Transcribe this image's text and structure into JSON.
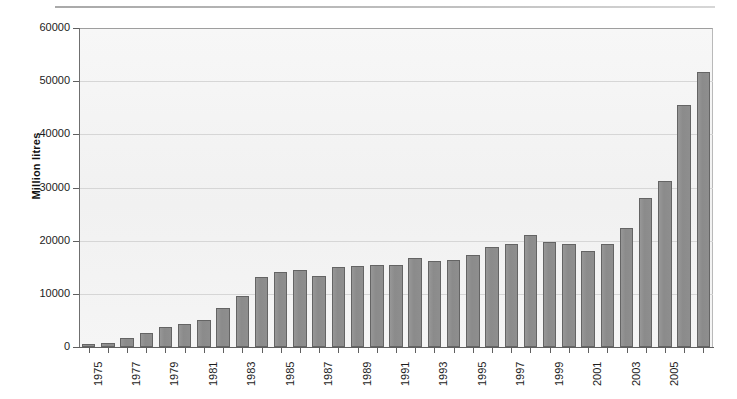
{
  "chart_data": {
    "type": "bar",
    "title": "",
    "xlabel": "",
    "ylabel": "Million litres",
    "ylim": [
      0,
      60000
    ],
    "ytick_values": [
      0,
      10000,
      20000,
      30000,
      40000,
      50000,
      60000
    ],
    "ytick_labels": [
      "0",
      "10000",
      "20000",
      "30000",
      "40000",
      "50000",
      "60000"
    ],
    "grid": true,
    "legend": "none",
    "categories": [
      "1975",
      "1976",
      "1977",
      "1978",
      "1979",
      "1980",
      "1981",
      "1982",
      "1983",
      "1984",
      "1985",
      "1986",
      "1987",
      "1988",
      "1989",
      "1990",
      "1991",
      "1992",
      "1993",
      "1994",
      "1995",
      "1996",
      "1997",
      "1998",
      "1999",
      "2000",
      "2001",
      "2002",
      "2003",
      "2004",
      "2005",
      "2006"
    ],
    "visible_xtick_labels": [
      "1975",
      "1977",
      "1979",
      "1981",
      "1983",
      "1985",
      "1987",
      "1989",
      "1991",
      "1993",
      "1995",
      "1997",
      "1999",
      "2001",
      "2003",
      "2005"
    ],
    "values": [
      600,
      800,
      1700,
      2600,
      3700,
      4300,
      5100,
      7300,
      9600,
      13100,
      14200,
      14400,
      13400,
      15000,
      15300,
      15400,
      15500,
      16700,
      16200,
      16300,
      17300,
      18800,
      19400,
      21000,
      19700,
      19400,
      18000,
      19300,
      22300,
      28100,
      31300,
      45600
    ],
    "last_value": 51800,
    "bar_color": "#8e8e8e",
    "bar_edge_color": "#646464",
    "plot_background": "#f4f4f4",
    "gridline_color": "#d6d6d6",
    "axis_color": "#5f5f5f"
  }
}
